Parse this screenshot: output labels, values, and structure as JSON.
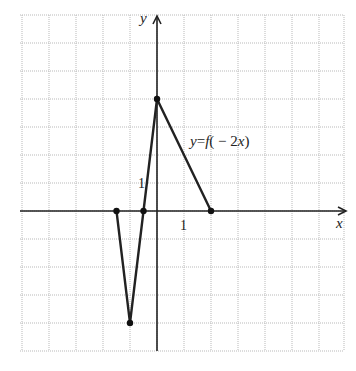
{
  "chart_data": {
    "type": "line",
    "title": "",
    "curve_label": "y = f(−2x)",
    "curve_label_parts": [
      "y",
      "=",
      "f",
      "(",
      "−",
      "2",
      "x",
      ")"
    ],
    "xlabel": "x",
    "ylabel": "y",
    "x_tick_labels": [
      {
        "value": 1,
        "label": "1"
      }
    ],
    "y_tick_labels": [
      {
        "value": 1,
        "label": "1"
      }
    ],
    "xlim": [
      -5,
      6.8
    ],
    "ylim": [
      -5,
      7
    ],
    "grid": true,
    "grid_style": "dotted",
    "series": [
      {
        "name": "y = f(−2x)",
        "points": [
          {
            "x": -1.5,
            "y": 0
          },
          {
            "x": -1,
            "y": -4
          },
          {
            "x": -0.5,
            "y": 0
          },
          {
            "x": 0,
            "y": 4
          },
          {
            "x": 2,
            "y": 0
          }
        ],
        "marked_points": true
      }
    ]
  },
  "colors": {
    "curve": "#222222",
    "grid": "#b9b9b9",
    "background": "#ffffff"
  }
}
